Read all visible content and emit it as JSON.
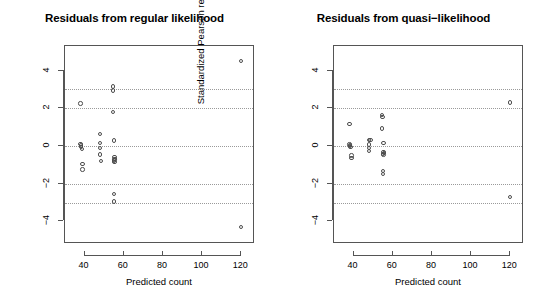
{
  "figure": {
    "background_color": "#ffffff",
    "point_color": "#4d4d4d",
    "axis_color": "#555555",
    "gridline_color": "#9a9a9a"
  },
  "chart_data": [
    {
      "type": "scatter",
      "title": "Residuals from regular likelihood",
      "xlabel": "Predicted count",
      "ylabel": "Standardized Pearson residuals",
      "xlim": [
        30,
        127
      ],
      "ylim": [
        -5.2,
        5.3
      ],
      "xticks": [
        40,
        60,
        80,
        100,
        120
      ],
      "yticks": [
        4,
        2,
        0,
        -2,
        -4
      ],
      "grid": true,
      "gridlines_y": [
        3,
        2,
        0,
        -2,
        -3
      ],
      "legend": "none",
      "points": [
        {
          "x": 38.0,
          "y": 2.25
        },
        {
          "x": 38.0,
          "y": 0.1
        },
        {
          "x": 38.3,
          "y": -0.05
        },
        {
          "x": 38.6,
          "y": -0.15
        },
        {
          "x": 38.2,
          "y": 0.02
        },
        {
          "x": 39.0,
          "y": -0.95
        },
        {
          "x": 39.0,
          "y": -1.25
        },
        {
          "x": 48.0,
          "y": 0.62
        },
        {
          "x": 48.0,
          "y": 0.15
        },
        {
          "x": 48.0,
          "y": -0.12
        },
        {
          "x": 48.0,
          "y": -0.45
        },
        {
          "x": 48.5,
          "y": -0.8
        },
        {
          "x": 54.5,
          "y": 3.15
        },
        {
          "x": 54.5,
          "y": 2.95
        },
        {
          "x": 54.5,
          "y": 1.8
        },
        {
          "x": 55.0,
          "y": 0.28
        },
        {
          "x": 55.2,
          "y": -0.6
        },
        {
          "x": 55.2,
          "y": -0.72
        },
        {
          "x": 55.4,
          "y": -0.68
        },
        {
          "x": 55.0,
          "y": -0.78
        },
        {
          "x": 55.3,
          "y": -0.85
        },
        {
          "x": 55.0,
          "y": -2.55
        },
        {
          "x": 55.0,
          "y": -2.95
        },
        {
          "x": 120.0,
          "y": 4.52
        },
        {
          "x": 120.0,
          "y": -4.3
        }
      ]
    },
    {
      "type": "scatter",
      "title": "Residuals from quasi−likelihood",
      "xlabel": "Predicted count",
      "ylabel": "Standardized Pearson residuals",
      "xlim": [
        30,
        127
      ],
      "ylim": [
        -5.2,
        5.3
      ],
      "xticks": [
        40,
        60,
        80,
        100,
        120
      ],
      "yticks": [
        4,
        2,
        0,
        -2,
        -4
      ],
      "grid": true,
      "gridlines_y": [
        3,
        2,
        0,
        -2,
        -3
      ],
      "legend": "none",
      "points": [
        {
          "x": 38.0,
          "y": 1.15
        },
        {
          "x": 38.0,
          "y": 0.08
        },
        {
          "x": 38.3,
          "y": 0.0
        },
        {
          "x": 38.5,
          "y": -0.05
        },
        {
          "x": 38.2,
          "y": 0.05
        },
        {
          "x": 39.0,
          "y": -0.5
        },
        {
          "x": 39.0,
          "y": -0.65
        },
        {
          "x": 48.0,
          "y": 0.32
        },
        {
          "x": 48.6,
          "y": 0.3
        },
        {
          "x": 48.0,
          "y": 0.08
        },
        {
          "x": 48.0,
          "y": -0.1
        },
        {
          "x": 48.0,
          "y": -0.28
        },
        {
          "x": 54.5,
          "y": 1.65
        },
        {
          "x": 54.8,
          "y": 1.52
        },
        {
          "x": 54.5,
          "y": 0.92
        },
        {
          "x": 55.2,
          "y": 0.15
        },
        {
          "x": 55.2,
          "y": -0.32
        },
        {
          "x": 55.4,
          "y": -0.38
        },
        {
          "x": 55.0,
          "y": -0.42
        },
        {
          "x": 55.3,
          "y": -0.45
        },
        {
          "x": 55.0,
          "y": -1.32
        },
        {
          "x": 55.0,
          "y": -1.5
        },
        {
          "x": 120.0,
          "y": 2.3
        },
        {
          "x": 120.0,
          "y": -2.7
        }
      ]
    }
  ]
}
